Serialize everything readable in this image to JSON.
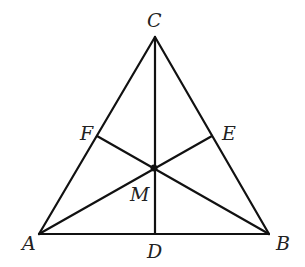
{
  "diagram": {
    "type": "triangle-with-medians",
    "colors": {
      "stroke": "#111111",
      "label": "#222222",
      "background": "#ffffff"
    },
    "points": {
      "A": {
        "label": "A",
        "x": 39,
        "y": 234,
        "label_x": 22,
        "label_y": 250
      },
      "B": {
        "label": "B",
        "x": 269,
        "y": 234,
        "label_x": 276,
        "label_y": 250
      },
      "C": {
        "label": "C",
        "x": 155,
        "y": 37,
        "label_x": 147,
        "label_y": 27
      },
      "D": {
        "label": "D",
        "x": 155,
        "y": 234,
        "label_x": 147,
        "label_y": 258
      },
      "E": {
        "label": "E",
        "x": 212,
        "y": 136,
        "label_x": 222,
        "label_y": 140
      },
      "F": {
        "label": "F",
        "x": 97,
        "y": 136,
        "label_x": 80,
        "label_y": 140
      },
      "M": {
        "label": "M",
        "x": 154,
        "y": 168,
        "label_x": 130,
        "label_y": 201
      }
    },
    "segments": [
      {
        "name": "side-AB",
        "from": "A",
        "to": "B"
      },
      {
        "name": "side-BC",
        "from": "B",
        "to": "C"
      },
      {
        "name": "side-CA",
        "from": "C",
        "to": "A"
      },
      {
        "name": "median-CD",
        "from": "C",
        "to": "D"
      },
      {
        "name": "median-AE",
        "from": "A",
        "to": "E"
      },
      {
        "name": "median-BF",
        "from": "B",
        "to": "F"
      }
    ],
    "centroid_dot": {
      "point": "M",
      "radius": 3.5
    }
  }
}
